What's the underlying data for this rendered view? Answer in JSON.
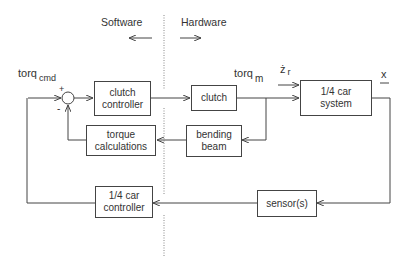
{
  "diagram": {
    "type": "block-diagram",
    "regions": {
      "software_label": "Software",
      "hardware_label": "Hardware"
    },
    "signals": {
      "torq_cmd": {
        "base": "torq",
        "subscript": "cmd"
      },
      "torq_m": {
        "base": "torq",
        "subscript": "m"
      },
      "z_r_dot": {
        "base": "ż",
        "subscript": "r"
      },
      "x": "x"
    },
    "summing_junction": {
      "plus": "+",
      "minus": "-"
    },
    "blocks": {
      "clutch_controller": {
        "line1": "clutch",
        "line2": "controller"
      },
      "clutch": {
        "line1": "clutch"
      },
      "bending_beam": {
        "line1": "bending",
        "line2": "beam"
      },
      "torque_calculations": {
        "line1": "torque",
        "line2": "calculations"
      },
      "car_system": {
        "line1": "1/4 car",
        "line2": "system"
      },
      "car_controller": {
        "line1": "1/4 car",
        "line2": "controller"
      },
      "sensors": {
        "line1": "sensor(s)"
      }
    },
    "colors": {
      "line": "#444444",
      "text": "#333333",
      "divider": "#888888"
    }
  }
}
